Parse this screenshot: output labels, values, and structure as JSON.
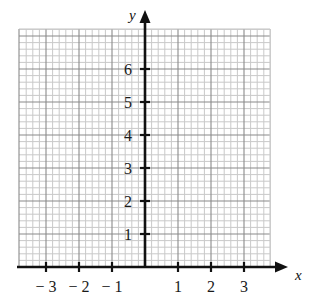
{
  "figure": {
    "type": "blank-coordinate-grid",
    "width": 314,
    "height": 307,
    "background_color": "#ffffff"
  },
  "chart_data": {
    "type": "scatter",
    "title": "",
    "subtitle": "",
    "xlabel": "x",
    "ylabel": "y",
    "xlim": [
      -3.8,
      3.8
    ],
    "ylim": [
      -0.1,
      7.2
    ],
    "x_ticks": [
      -3,
      -2,
      -1,
      1,
      2,
      3
    ],
    "y_ticks": [
      1,
      2,
      3,
      4,
      5,
      6
    ],
    "x_tick_labels": [
      "− 3",
      "− 2",
      "− 1",
      "1",
      "2",
      "3"
    ],
    "y_tick_labels": [
      "1",
      "2",
      "3",
      "4",
      "5",
      "6"
    ],
    "x_minor_step": 0.2,
    "y_minor_step": 0.2,
    "grid": true,
    "grid_minor": true,
    "legend": false,
    "legend_position": "none",
    "series": [],
    "annotations": [],
    "origin_label": "",
    "x_axis_arrow": true,
    "y_axis_arrow": true,
    "grid_x_range": [
      -3.8,
      3.8
    ],
    "grid_y_range": [
      0,
      7.2
    ]
  },
  "colors": {
    "axis": "#111111",
    "grid_major": "#8a8a8a",
    "grid_minor": "#c9c9c9",
    "tick_label": "#1a1a1a",
    "axis_label": "#111111",
    "background": "#ffffff"
  },
  "geometry": {
    "origin_x_px": 145,
    "origin_y_px": 267,
    "unit_px": 33,
    "grid_left_px": 19,
    "grid_right_px": 270,
    "grid_top_px": 29,
    "grid_bottom_px": 267,
    "x_arrow_tip_px": 288,
    "y_arrow_tip_px": 10,
    "tick_half_length_px": 5
  },
  "axis_names": {
    "x": "x",
    "y": "y"
  }
}
